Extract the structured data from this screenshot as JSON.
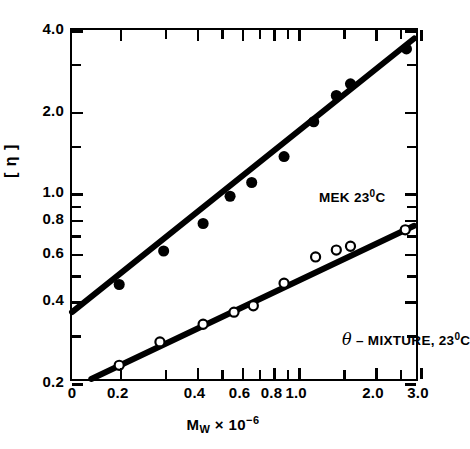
{
  "chart_data": {
    "type": "scatter",
    "title": "",
    "xlabel": "M_w x 10^-6",
    "ylabel": "[n]",
    "xscale": "log",
    "yscale": "log",
    "xlim": [
      0.13,
      3.0
    ],
    "ylim": [
      0.2,
      4.0
    ],
    "grid": false,
    "legend_position": "inline-annotation",
    "xticks": [
      0.2,
      0.4,
      0.6,
      0.8,
      1.0,
      2.0,
      3.0
    ],
    "xticklabels": [
      "0.2",
      "0.4",
      "0.6",
      "0.8",
      "1.0",
      "2.0",
      "3.0"
    ],
    "xtick_minor": [
      0.3,
      0.5,
      0.7,
      0.9,
      1.5,
      2.5
    ],
    "x_origin_label": "0",
    "yticks": [
      0.2,
      0.4,
      0.6,
      0.8,
      1.0,
      2.0,
      4.0
    ],
    "yticklabels": [
      "0.2",
      "0.4",
      "0.6",
      "0.8",
      "1.0",
      "2.0",
      "4.0"
    ],
    "ytick_minor": [
      0.3,
      0.5,
      0.7,
      0.9,
      1.5,
      3.0
    ],
    "series": [
      {
        "name": "MEK 23°C",
        "marker": "filled-circle",
        "color": "#000000",
        "points": [
          {
            "x": 0.2,
            "y": 0.45
          },
          {
            "x": 0.3,
            "y": 0.6
          },
          {
            "x": 0.43,
            "y": 0.76
          },
          {
            "x": 0.55,
            "y": 0.96
          },
          {
            "x": 0.67,
            "y": 1.08
          },
          {
            "x": 0.9,
            "y": 1.35
          },
          {
            "x": 1.18,
            "y": 1.82
          },
          {
            "x": 1.45,
            "y": 2.28
          },
          {
            "x": 1.65,
            "y": 2.52
          },
          {
            "x": 2.75,
            "y": 3.4
          }
        ],
        "fit_line": {
          "x1": 0.13,
          "y1": 0.355,
          "x2": 2.95,
          "y2": 3.72
        }
      },
      {
        "name": "θ – MIXTURE, 23°C",
        "marker": "open-circle",
        "color": "#000000",
        "points": [
          {
            "x": 0.2,
            "y": 0.225
          },
          {
            "x": 0.29,
            "y": 0.275
          },
          {
            "x": 0.43,
            "y": 0.32
          },
          {
            "x": 0.57,
            "y": 0.355
          },
          {
            "x": 0.68,
            "y": 0.375
          },
          {
            "x": 0.9,
            "y": 0.455
          },
          {
            "x": 1.2,
            "y": 0.57
          },
          {
            "x": 1.45,
            "y": 0.605
          },
          {
            "x": 1.65,
            "y": 0.625
          },
          {
            "x": 2.72,
            "y": 0.72
          }
        ],
        "fit_line": {
          "x1": 0.155,
          "y1": 0.2,
          "x2": 2.95,
          "y2": 0.745
        }
      }
    ]
  },
  "axis": {
    "x_title_main": "M",
    "x_title_sub": "W",
    "x_title_times": " × 10",
    "x_title_sup": "−6",
    "y_title": "[ η ]"
  },
  "annotations": {
    "mek": {
      "text": "MEK 23",
      "sup": "0",
      "tail": "C"
    },
    "theta": {
      "theta": "θ",
      "text": " – MIXTURE, 23",
      "sup": "0",
      "tail": "C"
    }
  }
}
